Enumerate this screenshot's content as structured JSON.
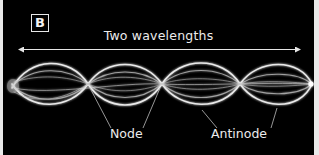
{
  "figure": {
    "panel_label": "B",
    "span_label": "Two wavelengths",
    "callouts": {
      "node": "Node",
      "antinode": "Antinode"
    },
    "colors": {
      "background": "#000000",
      "wave": "#ffffff",
      "text": "#ececec",
      "page": "#e9e9e9"
    },
    "wave": {
      "type": "standing-wave",
      "wavelengths_shown": 2,
      "node_x_px": [
        12,
        88,
        162,
        240,
        312
      ],
      "centerline_y_px": 84,
      "amplitude_px": 24
    }
  }
}
